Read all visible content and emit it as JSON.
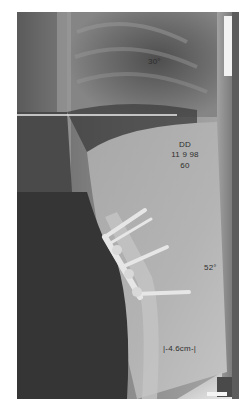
{
  "image": {
    "type": "lateral spine radiograph",
    "description": "Lateral X-ray showing thoracolumbar spine with posterior/anterior instrumentation screws and rods",
    "colors": {
      "background": "#ffffff",
      "soft_tissue_dark": "#3a3a3a",
      "lung_field": "#6d6d6d",
      "bone_light": "#c8c8c8",
      "hardware": "#e4e4e4",
      "reference_line": "#e8e8e8"
    }
  },
  "annotations": {
    "top_angle": "30°",
    "initials": "DD",
    "date": "11 9 98",
    "number": "60",
    "lower_angle": "52°",
    "measurement": "|-4.6cm-|"
  }
}
